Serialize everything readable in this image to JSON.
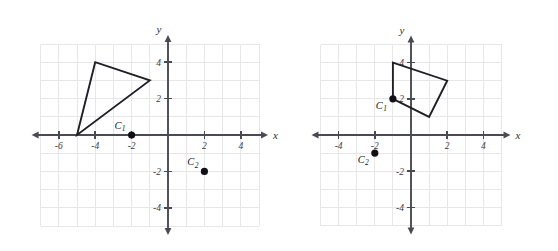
{
  "figure": {
    "title": "",
    "background_color": "#ffffff",
    "grid_color": "#e9e6ea",
    "axis_color": "#4a4a55",
    "shape_color": "#201f26",
    "point_color": "#111016"
  },
  "chart_data": [
    {
      "type": "scatter",
      "panel_id": "left",
      "title": "",
      "xlabel": "x",
      "ylabel": "y",
      "xlim": [
        -7,
        5
      ],
      "ylim": [
        -5,
        5
      ],
      "grid": true,
      "grid_step": 1,
      "x_ticks": [
        -6,
        -4,
        -2,
        2,
        4,
        6
      ],
      "x_tick_labels": [
        "-6",
        "-4",
        "-2",
        "2",
        "4",
        "6"
      ],
      "y_ticks": [
        4,
        2,
        -2,
        -4
      ],
      "y_tick_labels": [
        "4",
        "2",
        "-2",
        "-4"
      ],
      "shapes": [
        {
          "name": "triangle",
          "closed": true,
          "vertices": [
            [
              -5,
              0
            ],
            [
              -4,
              4
            ],
            [
              -1,
              3
            ]
          ]
        }
      ],
      "points": [
        {
          "label": "C",
          "subscript": "1",
          "x": -2,
          "y": 0,
          "label_position": "above-left"
        },
        {
          "label": "C",
          "subscript": "2",
          "x": 2,
          "y": -2,
          "label_position": "above-left"
        }
      ]
    },
    {
      "type": "scatter",
      "panel_id": "right",
      "title": "",
      "xlabel": "x",
      "ylabel": "y",
      "xlim": [
        -5,
        5
      ],
      "ylim": [
        -5,
        5
      ],
      "grid": true,
      "grid_step": 1,
      "x_ticks": [
        -4,
        -2,
        2,
        4
      ],
      "x_tick_labels": [
        "-4",
        "-2",
        "2",
        "4"
      ],
      "y_ticks": [
        4,
        2,
        -2,
        -4
      ],
      "y_tick_labels": [
        "4",
        "2",
        "-2",
        "-4"
      ],
      "shapes": [
        {
          "name": "quadrilateral",
          "closed": true,
          "vertices": [
            [
              -1,
              4
            ],
            [
              2,
              3
            ],
            [
              1,
              1
            ],
            [
              -1,
              2
            ]
          ]
        }
      ],
      "points": [
        {
          "label": "C",
          "subscript": "1",
          "x": -1,
          "y": 2,
          "label_position": "below-left"
        },
        {
          "label": "C",
          "subscript": "2",
          "x": -2,
          "y": -1,
          "label_position": "below-left"
        }
      ]
    }
  ]
}
